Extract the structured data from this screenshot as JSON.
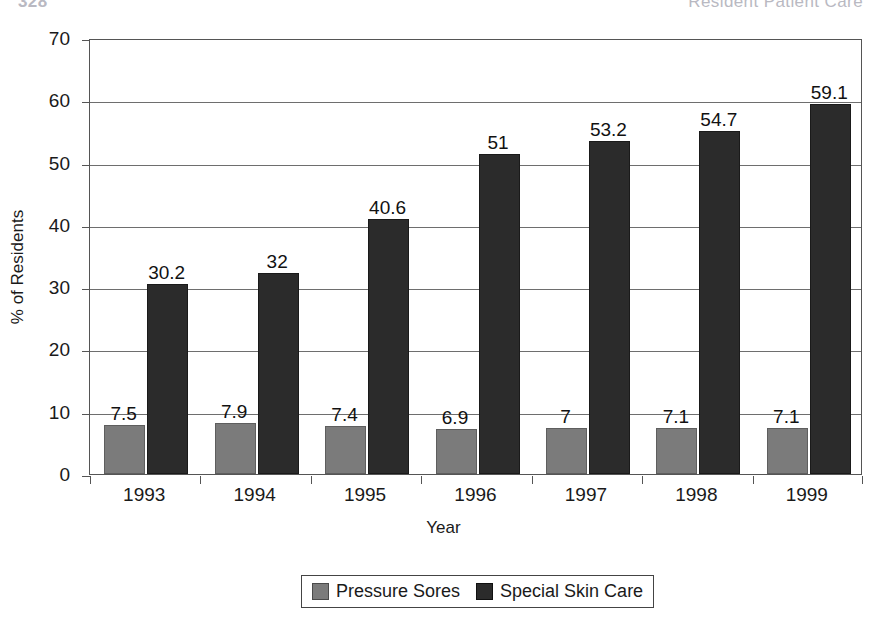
{
  "page_header": {
    "left_text": "328",
    "right_text": "Resident Patient Care"
  },
  "chart_data": {
    "type": "bar",
    "title": "",
    "subtitle": "",
    "xlabel": "Year",
    "ylabel": "% of Residents",
    "categories": [
      "1993",
      "1994",
      "1995",
      "1996",
      "1997",
      "1998",
      "1999"
    ],
    "series": [
      {
        "name": "Pressure Sores",
        "color": "#7b7b7b",
        "values": [
          7.5,
          7.9,
          7.4,
          6.9,
          7,
          7.1,
          7.1
        ],
        "labels": [
          "7.5",
          "7.9",
          "7.4",
          "6.9",
          "7",
          "7.1",
          "7.1"
        ]
      },
      {
        "name": "Special Skin Care",
        "color": "#2b2b2b",
        "values": [
          30.2,
          32,
          40.6,
          51,
          53.2,
          54.7,
          59.1
        ],
        "labels": [
          "30.2",
          "32",
          "40.6",
          "51",
          "53.2",
          "54.7",
          "59.1"
        ]
      }
    ],
    "ylim": [
      0,
      70
    ],
    "yticks": [
      0,
      10,
      20,
      30,
      40,
      50,
      60,
      70
    ],
    "ytick_labels": [
      "0",
      "10",
      "20",
      "30",
      "40",
      "50",
      "60",
      "70"
    ],
    "grid": true,
    "grid_axis": "y",
    "legend_position": "bottom",
    "data_labels": true
  }
}
